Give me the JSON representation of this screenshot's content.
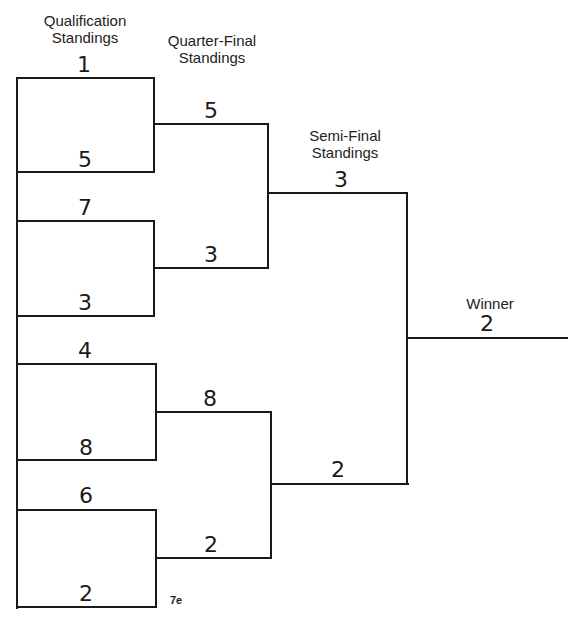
{
  "headers": {
    "qualification": "Qualification\nStandings",
    "quarter_final": "Quarter-Final\nStandings",
    "semi_final": "Semi-Final\nStandings",
    "winner": "Winner"
  },
  "bracket": {
    "qualification": [
      "1",
      "5",
      "7",
      "3",
      "4",
      "8",
      "6",
      "2"
    ],
    "quarter_final": [
      "5",
      "3",
      "8",
      "2"
    ],
    "semi_final": [
      "3",
      "2"
    ],
    "winner": "2"
  },
  "figure_label": "7e",
  "colors": {
    "line": "#1a1a1a",
    "background": "#ffffff"
  }
}
